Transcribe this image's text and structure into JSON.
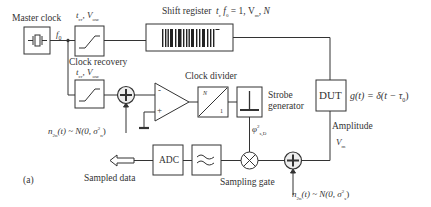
{
  "diagram": {
    "type": "block-diagram",
    "panel_label": "(a)",
    "blocks": {
      "master_clock": {
        "label": "Master clock",
        "output": "f0"
      },
      "clock_gen_top": {
        "params": "t_cr, V_osc"
      },
      "clock_recovery": {
        "label": "Clock recovery",
        "params": "t_cr, V_osc"
      },
      "shift_register": {
        "label": "Shift register",
        "params": "t_c f_0 = 1, V_m, N"
      },
      "dut": {
        "label": "DUT",
        "response": "g(t) = δ(t − τ0)"
      },
      "amplitude": {
        "label": "Amplitude",
        "symbol": "V_m"
      },
      "summer_top": {
        "symbol": "+"
      },
      "comparator": {
        "minus": "-",
        "plus": "+"
      },
      "clock_divider": {
        "label": "Clock divider",
        "top": "N",
        "bottom": "1"
      },
      "strobe_generator": {
        "label_line1": "Strobe",
        "label_line2": "generator",
        "output": "φ²_s,D"
      },
      "sampling_gate": {
        "label": "Sampling gate"
      },
      "summer_bottom": {
        "symbol": "+"
      },
      "filter": {
        "label": "≈"
      },
      "adc": {
        "label": "ADC"
      },
      "sampled_data": {
        "label": "Sampled data"
      }
    },
    "noise_sources": {
      "clock_noise": {
        "text": "n_2n(t) ~ N(0, σ²_n)"
      },
      "signal_noise": {
        "text": "n_2n(t) ~ N(0, σ²_s)"
      }
    }
  },
  "text": {
    "master_clock": "Master clock",
    "f0": "f",
    "f0_sub": "0",
    "tcr1": "t",
    "tcr1_sub": "cr",
    "vosc1": ", V",
    "vosc1_sub": "osc",
    "shift_reg": "Shift register",
    "shift_params_a": "t",
    "shift_params_a_sub": "c",
    "shift_params_b": " f",
    "shift_params_b_sub": "0",
    "shift_params_c": " = 1, V",
    "shift_params_c_sub": "m",
    "shift_params_d": ",  N",
    "clock_recovery": "Clock recovery",
    "tcr2": "t",
    "tcr2_sub": "cr",
    "vosc2": ", V",
    "vosc2_sub": "osc",
    "clock_divider": "Clock divider",
    "div_n": "N",
    "div_1": "1",
    "strobe1": "Strobe",
    "strobe2": "generator",
    "dut": "DUT",
    "g_t": "g(t) = δ(t − τ",
    "g_t_sub": "0",
    "g_t_close": ")",
    "amplitude": "Amplitude",
    "vm": "V",
    "vm_sub": "m",
    "phi": "φ",
    "phi_sup": "2",
    "phi_sub": "s,D",
    "noise1_a": "n",
    "noise1_a_sub": "2n",
    "noise1_b": "(t) ~ N(0, σ",
    "noise1_b_sup": "2",
    "noise1_b_sub": "n",
    "noise1_c": ")",
    "noise2_a": "n",
    "noise2_a_sub": "2n",
    "noise2_b": "(t) ~ N(0, σ",
    "noise2_b_sup": "2",
    "noise2_b_sub": "s",
    "noise2_c": ")",
    "adc": "ADC",
    "sampled": "Sampled data",
    "sampling_gate": "Sampling gate",
    "panel": "(a)",
    "minus": "-",
    "plus": "+"
  },
  "colors": {
    "line": "#333333",
    "background": "#ffffff",
    "fill_box": "#ffffff",
    "fill_sum": "#eeeeee"
  }
}
